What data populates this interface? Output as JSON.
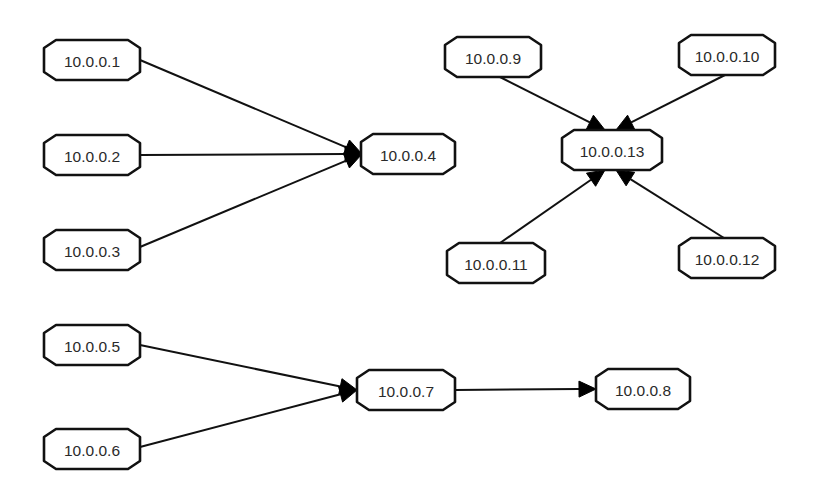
{
  "diagram": {
    "type": "network-graph",
    "node_style": {
      "stroke": "#111111",
      "fill": "#ffffff",
      "text_color": "#2a2a2a",
      "shape": "elongated-octagon"
    },
    "edge_style": {
      "stroke": "#111111",
      "arrowhead": "filled-triangle"
    },
    "nodes": [
      {
        "id": "n1",
        "label": "10.0.0.1",
        "cx": 92,
        "cy": 60,
        "w": 96,
        "h": 40
      },
      {
        "id": "n2",
        "label": "10.0.0.2",
        "cx": 92,
        "cy": 155,
        "w": 96,
        "h": 40
      },
      {
        "id": "n3",
        "label": "10.0.0.3",
        "cx": 92,
        "cy": 250,
        "w": 96,
        "h": 40
      },
      {
        "id": "n4",
        "label": "10.0.0.4",
        "cx": 408,
        "cy": 154,
        "w": 94,
        "h": 40
      },
      {
        "id": "n9",
        "label": "10.0.0.9",
        "cx": 493,
        "cy": 57,
        "w": 96,
        "h": 40
      },
      {
        "id": "n10",
        "label": "10.0.0.10",
        "cx": 727,
        "cy": 55,
        "w": 96,
        "h": 40
      },
      {
        "id": "n13",
        "label": "10.0.0.13",
        "cx": 612,
        "cy": 150,
        "w": 100,
        "h": 40
      },
      {
        "id": "n11",
        "label": "10.0.0.11",
        "cx": 496,
        "cy": 263,
        "w": 98,
        "h": 40
      },
      {
        "id": "n12",
        "label": "10.0.0.12",
        "cx": 727,
        "cy": 258,
        "w": 96,
        "h": 40
      },
      {
        "id": "n5",
        "label": "10.0.0.5",
        "cx": 92,
        "cy": 345,
        "w": 96,
        "h": 40
      },
      {
        "id": "n6",
        "label": "10.0.0.6",
        "cx": 92,
        "cy": 449,
        "w": 96,
        "h": 40
      },
      {
        "id": "n7",
        "label": "10.0.0.7",
        "cx": 406,
        "cy": 390,
        "w": 98,
        "h": 40
      },
      {
        "id": "n8",
        "label": "10.0.0.8",
        "cx": 643,
        "cy": 389,
        "w": 94,
        "h": 40
      }
    ],
    "edges": [
      {
        "from": "n1",
        "to": "n4",
        "x1": 140,
        "y1": 60,
        "x2": 362,
        "y2": 154
      },
      {
        "from": "n2",
        "to": "n4",
        "x1": 140,
        "y1": 155,
        "x2": 362,
        "y2": 154
      },
      {
        "from": "n3",
        "to": "n4",
        "x1": 140,
        "y1": 247,
        "x2": 362,
        "y2": 154
      },
      {
        "from": "n9",
        "to": "n13",
        "x1": 500,
        "y1": 77,
        "x2": 605,
        "y2": 130
      },
      {
        "from": "n10",
        "to": "n13",
        "x1": 725,
        "y1": 75,
        "x2": 616,
        "y2": 130
      },
      {
        "from": "n11",
        "to": "n13",
        "x1": 500,
        "y1": 243,
        "x2": 605,
        "y2": 170
      },
      {
        "from": "n12",
        "to": "n13",
        "x1": 724,
        "y1": 238,
        "x2": 616,
        "y2": 170
      },
      {
        "from": "n5",
        "to": "n7",
        "x1": 140,
        "y1": 345,
        "x2": 357,
        "y2": 390
      },
      {
        "from": "n6",
        "to": "n7",
        "x1": 140,
        "y1": 447,
        "x2": 357,
        "y2": 390
      },
      {
        "from": "n7",
        "to": "n8",
        "x1": 455,
        "y1": 390,
        "x2": 596,
        "y2": 389
      }
    ]
  }
}
